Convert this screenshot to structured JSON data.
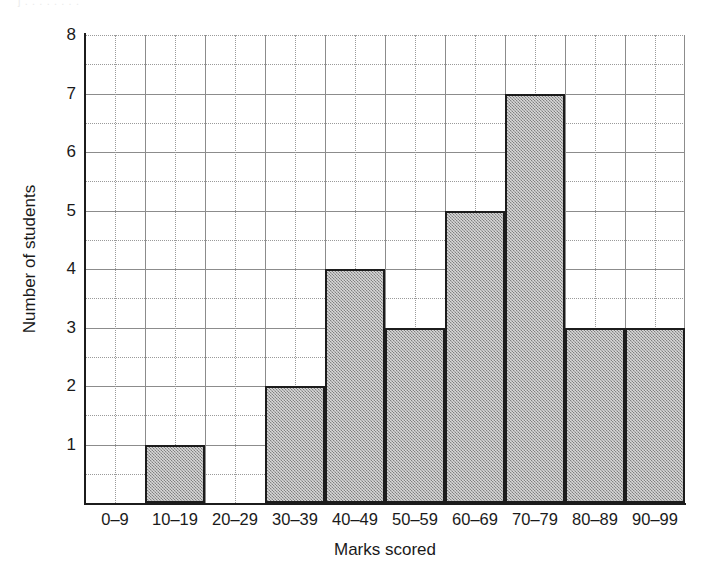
{
  "figure": {
    "top_artifact_text": "j  .  . . . . . . ."
  },
  "chart_data": {
    "type": "bar",
    "title": "",
    "subtitle": "",
    "xlabel": "Marks scored",
    "ylabel": "Number of students",
    "categories": [
      "0–9",
      "10–19",
      "20–29",
      "30–39",
      "40–49",
      "50–59",
      "60–69",
      "70–79",
      "80–89",
      "90–99"
    ],
    "values": [
      0,
      1,
      0,
      2,
      4,
      3,
      5,
      7,
      3,
      3
    ],
    "ylim": [
      0,
      8
    ],
    "yticks": [
      1,
      2,
      3,
      4,
      5,
      6,
      7,
      8
    ],
    "ytick_labels": [
      "1",
      "2",
      "3",
      "4",
      "5",
      "6",
      "7",
      "8"
    ],
    "y_minor_step": 0.5,
    "grid": true,
    "grid_style": "major solid grey at integers and half-units, dotted minor",
    "legend": "none",
    "bar_fill_color": "#a6a6a6",
    "bar_edge_color": "#1c1c1c",
    "axis_color": "#1c1c1c",
    "grid_color": "#8c8c8c",
    "background_color": "#ffffff",
    "annotations": []
  }
}
